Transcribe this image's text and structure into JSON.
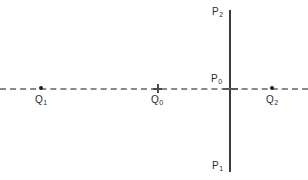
{
  "figure": {
    "width": 308,
    "height": 180,
    "background_color": "#ffffff"
  },
  "colors": {
    "vertical_line": "#3b3b3b",
    "dashed_line": "#8a8a8a",
    "marker": "#1e1e1e",
    "label_text": "#2b2b2b"
  },
  "lines": {
    "vertical": {
      "name": "P-line",
      "style": "solid",
      "x": 230,
      "y_top": 10,
      "y_bottom": 172
    },
    "horizontal": {
      "name": "Q-line",
      "style": "dashed",
      "y": 89,
      "x_left": 0,
      "x_right": 308
    }
  },
  "labels": {
    "p2": {
      "base": "P",
      "sub": "2"
    },
    "p0": {
      "base": "P",
      "sub": "0"
    },
    "p1": {
      "base": "P",
      "sub": "1"
    },
    "q1": {
      "base": "Q",
      "sub": "1"
    },
    "q0": {
      "base": "Q",
      "sub": "0"
    },
    "q2": {
      "base": "Q",
      "sub": "2"
    }
  },
  "markers": {
    "q1": {
      "type": "dot",
      "x": 41,
      "y": 88
    },
    "q0": {
      "type": "plus",
      "x": 157,
      "y": 89
    },
    "q2": {
      "type": "dot",
      "x": 272,
      "y": 88
    },
    "p0": {
      "type": "cross",
      "x": 230,
      "y": 89
    }
  }
}
